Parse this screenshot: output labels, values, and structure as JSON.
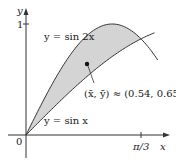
{
  "figure": {
    "y_axis_label": "y",
    "x_axis_label": "x",
    "y_tick_label": "1",
    "x_tick_label": "π/3",
    "origin_label": "0",
    "curve_upper_label": "y = sin 2x",
    "curve_lower_label": "y = sin x",
    "centroid_label": "(x̄, ȳ) ≈ (0.54, 0.65)",
    "colors": {
      "fill": "#d4d4d4",
      "curve": "#333333",
      "axis": "#333333",
      "text": "#1a1a1a"
    }
  },
  "chart_data": {
    "type": "area",
    "title": "",
    "xlabel": "x",
    "ylabel": "y",
    "xlim": [
      0,
      1.2
    ],
    "ylim": [
      0,
      1.05
    ],
    "x_ticks": [
      {
        "value": 1.0472,
        "label": "π/3"
      }
    ],
    "y_ticks": [
      {
        "value": 1,
        "label": "1"
      }
    ],
    "series": [
      {
        "name": "y = sin 2x",
        "x": [
          0,
          0.2618,
          0.5236,
          0.7854,
          1.0472,
          1.2
        ],
        "y": [
          0,
          0.5,
          0.866,
          1.0,
          0.866,
          0.675
        ]
      },
      {
        "name": "y = sin x",
        "x": [
          0,
          0.2618,
          0.5236,
          0.7854,
          1.0472,
          1.2
        ],
        "y": [
          0,
          0.259,
          0.5,
          0.707,
          0.866,
          0.932
        ]
      }
    ],
    "shaded_region": {
      "between": [
        "y = sin 2x",
        "y = sin x"
      ],
      "x_range": [
        0,
        1.0472
      ]
    },
    "annotations": [
      {
        "type": "point",
        "x": 0.54,
        "y": 0.65,
        "label": "(x̄, ȳ) ≈ (0.54, 0.65)"
      }
    ],
    "grid": false
  }
}
